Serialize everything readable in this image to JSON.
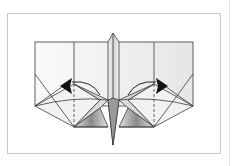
{
  "diagram": {
    "type": "origami-fold-diagram",
    "colors": {
      "line": "#3a3a3a",
      "frame": "#c8c8c8",
      "shade_dark": "#7a7a7a",
      "shade_light": "#f2f2f2",
      "arrow": "#111111"
    },
    "arrows": [
      {
        "side": "left",
        "direction": "left"
      },
      {
        "side": "right",
        "direction": "right"
      }
    ]
  }
}
